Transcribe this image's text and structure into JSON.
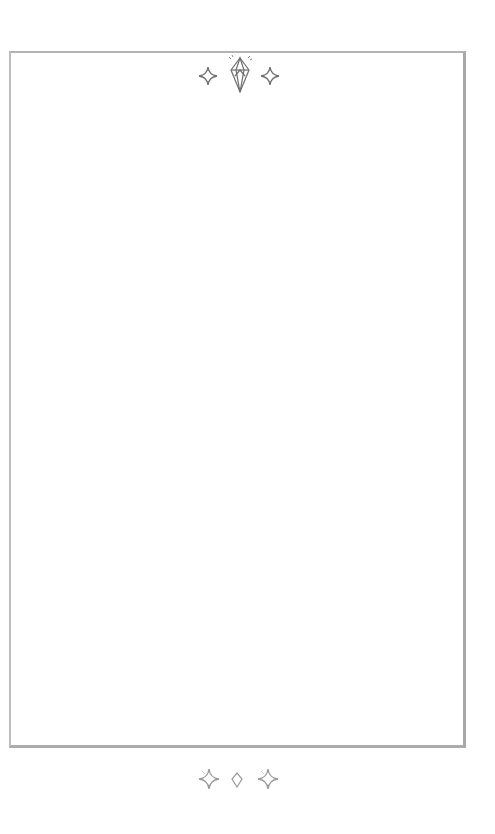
{
  "page": {
    "background": "#ffffff",
    "frame_color": "#b0b0b0",
    "content_text": ""
  },
  "top_ornament": {
    "icons": [
      "sparkle-icon",
      "crystal-gem-icon",
      "sparkle-icon"
    ],
    "color": "#6e6e6e"
  },
  "bottom_ornament": {
    "icons": [
      "sparkle-icon",
      "small-diamond-icon",
      "sparkle-icon"
    ],
    "color": "#9a9a9a"
  }
}
